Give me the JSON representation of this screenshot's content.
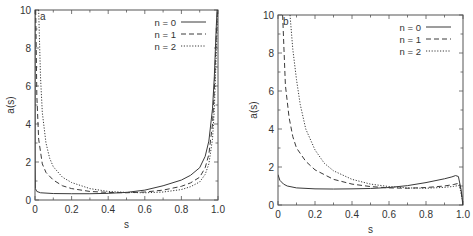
{
  "figure": {
    "panels": [
      {
        "id": "a",
        "panel_label": "a",
        "xlabel": "s",
        "ylabel": "a(s)",
        "frame": {
          "left": 35,
          "right": 218,
          "top": 10,
          "bottom": 200
        }
      },
      {
        "id": "b",
        "panel_label": "b",
        "xlabel": "s",
        "ylabel": "a(s)",
        "frame": {
          "left": 278,
          "right": 463,
          "top": 15,
          "bottom": 205
        }
      }
    ],
    "colors": {
      "axis": "#555555",
      "curve": "#3a3a3a",
      "text": "#333333"
    }
  },
  "chart_data": [
    {
      "type": "line",
      "title": "a",
      "xlabel": "s",
      "ylabel": "a(s)",
      "xlim": [
        0,
        1.0
      ],
      "ylim": [
        0,
        10
      ],
      "xticks": [
        0,
        0.2,
        0.4,
        0.6,
        0.8,
        1.0
      ],
      "xtick_labels": [
        "0",
        "0.2",
        "0.4",
        "0.6",
        "0.8",
        "1.0"
      ],
      "yticks": [
        0,
        2,
        4,
        6,
        8,
        10
      ],
      "ytick_labels": [
        "0",
        "2",
        "4",
        "6",
        "8",
        "10"
      ],
      "grid": false,
      "legend_position": "upper right",
      "series": [
        {
          "name": "n = 0",
          "style": "solid",
          "x": [
            0.0,
            0.0005,
            0.002,
            0.01,
            0.03,
            0.1,
            0.2,
            0.3,
            0.4,
            0.5,
            0.6,
            0.7,
            0.8,
            0.85,
            0.9,
            0.93,
            0.95,
            0.97,
            0.98,
            0.99,
            0.995
          ],
          "y": [
            10,
            2.0,
            0.6,
            0.45,
            0.38,
            0.34,
            0.33,
            0.33,
            0.35,
            0.4,
            0.52,
            0.75,
            1.05,
            1.3,
            1.7,
            2.3,
            3.1,
            4.8,
            6.5,
            9.0,
            10
          ]
        },
        {
          "name": "n = 1",
          "style": "dashed",
          "x": [
            0.004,
            0.01,
            0.02,
            0.04,
            0.06,
            0.1,
            0.15,
            0.2,
            0.3,
            0.4,
            0.5,
            0.6,
            0.7,
            0.8,
            0.85,
            0.9,
            0.93,
            0.95,
            0.97,
            0.98,
            0.99,
            0.997
          ],
          "y": [
            10,
            5.5,
            3.2,
            1.9,
            1.45,
            1.05,
            0.75,
            0.6,
            0.45,
            0.4,
            0.38,
            0.42,
            0.52,
            0.72,
            0.9,
            1.2,
            1.7,
            2.4,
            4.0,
            5.8,
            8.5,
            10
          ]
        },
        {
          "name": "n = 2",
          "style": "dotted",
          "x": [
            0.02,
            0.03,
            0.04,
            0.06,
            0.08,
            0.1,
            0.15,
            0.2,
            0.3,
            0.4,
            0.5,
            0.6,
            0.7,
            0.8,
            0.85,
            0.9,
            0.93,
            0.95,
            0.97,
            0.98,
            0.99,
            0.998
          ],
          "y": [
            10,
            6.5,
            4.6,
            3.0,
            2.2,
            1.75,
            1.2,
            0.92,
            0.6,
            0.45,
            0.4,
            0.38,
            0.42,
            0.55,
            0.7,
            0.95,
            1.35,
            1.9,
            3.2,
            4.8,
            7.5,
            10
          ]
        }
      ]
    },
    {
      "type": "line",
      "title": "b",
      "xlabel": "s",
      "ylabel": "a(s)",
      "xlim": [
        0,
        1.0
      ],
      "ylim": [
        0,
        10
      ],
      "xticks": [
        0,
        0.2,
        0.4,
        0.6,
        0.8,
        1.0
      ],
      "xtick_labels": [
        "0",
        "0.2",
        "0.4",
        "0.6",
        "0.8",
        "1.0"
      ],
      "yticks": [
        0,
        2,
        4,
        6,
        8,
        10
      ],
      "ytick_labels": [
        "0",
        "2",
        "4",
        "6",
        "8",
        "10"
      ],
      "grid": false,
      "legend_position": "upper right",
      "series": [
        {
          "name": "n = 0",
          "style": "solid",
          "x": [
            0.0,
            0.01,
            0.03,
            0.05,
            0.1,
            0.2,
            0.3,
            0.4,
            0.5,
            0.6,
            0.7,
            0.8,
            0.9,
            0.94,
            0.96,
            0.975,
            0.99,
            1.0
          ],
          "y": [
            1.6,
            1.3,
            1.1,
            1.0,
            0.9,
            0.85,
            0.84,
            0.85,
            0.87,
            0.92,
            1.02,
            1.18,
            1.38,
            1.48,
            1.55,
            1.5,
            0.8,
            0.0
          ]
        },
        {
          "name": "n = 1",
          "style": "dashed",
          "x": [
            0.025,
            0.04,
            0.06,
            0.08,
            0.1,
            0.15,
            0.2,
            0.3,
            0.4,
            0.5,
            0.6,
            0.7,
            0.8,
            0.9,
            0.95,
            0.98,
            0.99,
            1.0
          ],
          "y": [
            10,
            6.3,
            4.6,
            3.6,
            3.0,
            2.3,
            1.85,
            1.35,
            1.1,
            0.97,
            0.9,
            0.88,
            0.92,
            1.0,
            1.08,
            1.15,
            0.7,
            0.0
          ]
        },
        {
          "name": "n = 2",
          "style": "dotted",
          "x": [
            0.065,
            0.08,
            0.1,
            0.12,
            0.15,
            0.2,
            0.25,
            0.3,
            0.4,
            0.5,
            0.6,
            0.7,
            0.8,
            0.9,
            0.95,
            0.98,
            0.99,
            1.0
          ],
          "y": [
            10,
            8.2,
            6.6,
            5.3,
            4.0,
            2.9,
            2.2,
            1.8,
            1.35,
            1.1,
            0.97,
            0.9,
            0.88,
            0.93,
            0.98,
            1.03,
            0.6,
            0.0
          ]
        }
      ]
    }
  ]
}
